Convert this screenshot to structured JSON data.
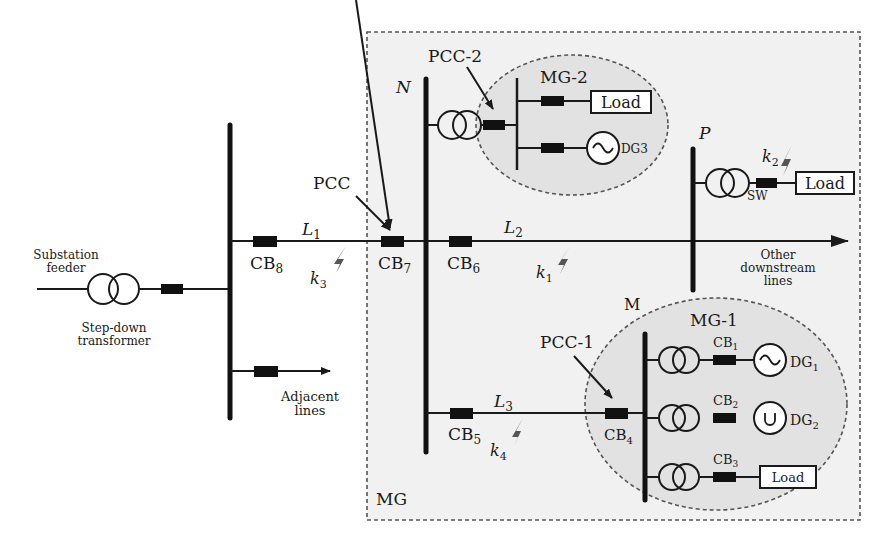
{
  "diagram": {
    "type": "single-line power distribution diagram with microgrids",
    "region_labels": {
      "outer_microgrid": "MG",
      "microgrid_1": "MG-1",
      "microgrid_2": "MG-2"
    },
    "buses": {
      "n": "N",
      "p": "P",
      "m": "M"
    },
    "lines": {
      "l1": {
        "main": "L",
        "sub": "1"
      },
      "l2": {
        "main": "L",
        "sub": "2"
      },
      "l3": {
        "main": "L",
        "sub": "3"
      }
    },
    "breakers": {
      "cb1": {
        "main": "CB",
        "sub": "1"
      },
      "cb2": {
        "main": "CB",
        "sub": "2"
      },
      "cb3": {
        "main": "CB",
        "sub": "3"
      },
      "cb4": {
        "main": "CB",
        "sub": "4"
      },
      "cb5": {
        "main": "CB",
        "sub": "5"
      },
      "cb6": {
        "main": "CB",
        "sub": "6"
      },
      "cb7": {
        "main": "CB",
        "sub": "7"
      },
      "cb8": {
        "main": "CB",
        "sub": "8"
      },
      "sw": "SW"
    },
    "faults": {
      "k1": {
        "main": "k",
        "sub": "1"
      },
      "k2": {
        "main": "k",
        "sub": "2"
      },
      "k3": {
        "main": "k",
        "sub": "3"
      },
      "k4": {
        "main": "k",
        "sub": "4"
      }
    },
    "pcc": {
      "main": "PCC",
      "pcc1": "PCC-1",
      "pcc2": "PCC-2"
    },
    "generators": {
      "dg1": {
        "main": "DG",
        "sub": "1"
      },
      "dg2": {
        "main": "DG",
        "sub": "2"
      },
      "dg3": "DG3"
    },
    "loads": {
      "mg2_load": "Load",
      "p_load": "Load",
      "mg1_load": "Load"
    },
    "annotations": {
      "substation_line1": "Substation",
      "substation_line2": "feeder",
      "stepdown_line1": "Step-down",
      "stepdown_line2": "transformer",
      "adjacent_line1": "Adjacent",
      "adjacent_line2": "lines",
      "downstream_line1": "Other",
      "downstream_line2": "downstream",
      "downstream_line3": "lines"
    },
    "colors": {
      "microgrid_fill": "#f1f1f1",
      "sub_microgrid_fill": "#e2e2e2",
      "ink": "#1a1a1a",
      "fault_bolt": "#555555"
    }
  }
}
